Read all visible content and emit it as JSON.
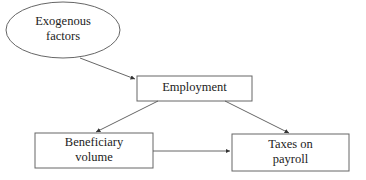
{
  "diagram": {
    "nodes": {
      "exogenous": {
        "line1": "Exogenous",
        "line2": "factors",
        "shape": "ellipse"
      },
      "employment": {
        "label": "Employment",
        "shape": "rectangle"
      },
      "beneficiary": {
        "line1": "Beneficiary",
        "line2": "volume",
        "shape": "rectangle"
      },
      "taxes": {
        "line1": "Taxes on",
        "line2": "payroll",
        "shape": "rectangle"
      }
    },
    "edges": [
      {
        "from": "Exogenous factors",
        "to": "Employment"
      },
      {
        "from": "Employment",
        "to": "Beneficiary volume"
      },
      {
        "from": "Employment",
        "to": "Taxes on payroll"
      },
      {
        "from": "Beneficiary volume",
        "to": "Taxes on payroll"
      }
    ],
    "colors": {
      "stroke": "#555555",
      "text": "#222222",
      "background": "#ffffff"
    }
  }
}
